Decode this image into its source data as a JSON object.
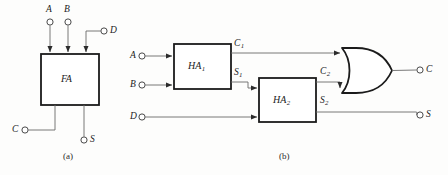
{
  "figure": {
    "background_color": "#fdfdfc",
    "line_color": "#555555",
    "block_stroke_color": "#1b1b1b",
    "label_color": "#1b1b1b"
  },
  "diagram_a": {
    "caption": "(a)",
    "block": {
      "name": "FA",
      "x": 41,
      "y": 54,
      "width": 58,
      "height": 51
    },
    "inputs": [
      {
        "id": "A",
        "label": "A",
        "terminal_x": 50,
        "terminal_y": 22,
        "enters_block_at_x": 50
      },
      {
        "id": "B",
        "label": "B",
        "terminal_x": 68,
        "terminal_y": 22,
        "enters_block_at_x": 68
      },
      {
        "id": "D",
        "label": "D",
        "terminal_x": 104,
        "terminal_y": 31,
        "enters_block_at_x": 86
      },
      {
        "id": "C",
        "label": "C",
        "terminal_x": 25,
        "terminal_y": 130,
        "enters_block_at_x": 55
      }
    ],
    "outputs": [
      {
        "id": "S",
        "label": "S",
        "terminal_x": 84,
        "terminal_y": 140,
        "leaves_block_at_x": 84
      }
    ]
  },
  "diagram_b": {
    "caption": "(b)",
    "blocks": [
      {
        "id": "HA1",
        "name": "HA",
        "subscript": "1",
        "x": 174,
        "y": 44,
        "width": 57,
        "height": 45
      },
      {
        "id": "HA2",
        "name": "HA",
        "subscript": "2",
        "x": 259,
        "y": 78,
        "width": 57,
        "height": 44
      }
    ],
    "or_gate": {
      "id": "OR1",
      "type": "or-gate",
      "x": 342,
      "y": 48,
      "width": 50,
      "height": 45
    },
    "inputs": [
      {
        "id": "A",
        "label": "A",
        "terminal_x": 142,
        "terminal_y": 56,
        "target": "HA1"
      },
      {
        "id": "B",
        "label": "B",
        "terminal_x": 142,
        "terminal_y": 85,
        "target": "HA1"
      },
      {
        "id": "D",
        "label": "D",
        "terminal_x": 142,
        "terminal_y": 117,
        "target": "HA2"
      }
    ],
    "internal_signals": [
      {
        "id": "C1",
        "label": "C",
        "subscript": "1",
        "label_x": 236,
        "label_y": 45,
        "from": "HA1",
        "to": "OR1"
      },
      {
        "id": "S1",
        "label": "S",
        "subscript": "1",
        "label_x": 236,
        "label_y": 74,
        "from": "HA1",
        "to": "HA2"
      },
      {
        "id": "C2",
        "label": "C",
        "subscript": "2",
        "label_x": 322,
        "label_y": 73,
        "from": "HA2",
        "to": "OR1"
      },
      {
        "id": "S2",
        "label": "S",
        "subscript": "2",
        "label_x": 322,
        "label_y": 102,
        "from": "HA2",
        "to": "S"
      }
    ],
    "outputs": [
      {
        "id": "C",
        "label": "C",
        "terminal_x": 420,
        "terminal_y": 70,
        "from": "OR1"
      },
      {
        "id": "S",
        "label": "S",
        "terminal_x": 420,
        "terminal_y": 115,
        "from": "HA2"
      }
    ]
  }
}
